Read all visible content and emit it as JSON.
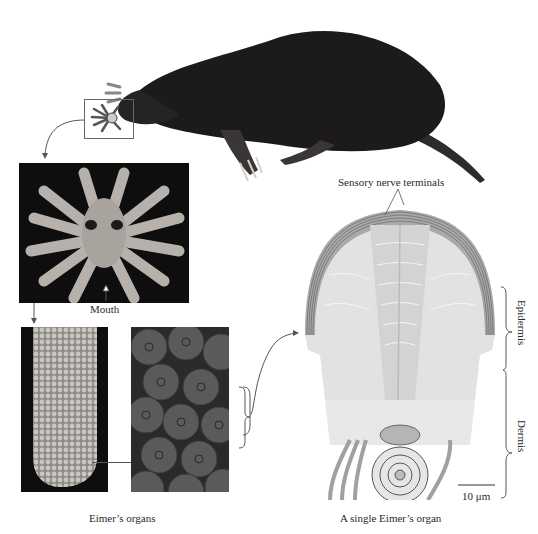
{
  "figure": {
    "labels": {
      "mouth": "Mouth",
      "eimers_organs": "Eimer’s organs",
      "sensory_nerve_terminals": "Sensory nerve terminals",
      "epidermis": "Epidermis",
      "dermis": "Dermis",
      "scale_bar": "10 μm",
      "single_organ": "A single Eimer’s organ"
    },
    "colors": {
      "background": "#ffffff",
      "mole_body": "#1c1a1c",
      "photo_bg": "#0e0e0e",
      "tissue_light": "#dcdcdc",
      "tissue_dark": "#a8a8a8",
      "line": "#555555"
    }
  }
}
